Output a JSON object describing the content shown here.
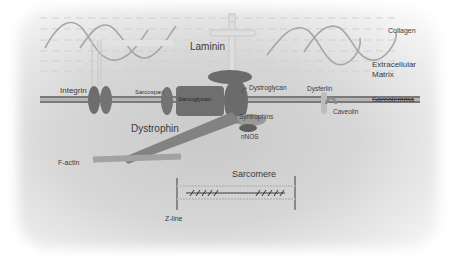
{
  "diagram": {
    "labels": {
      "laminin": "Laminin",
      "collagen": "Collagen",
      "ecm_line1": "Extracellular",
      "ecm_line2": "Matrix",
      "integrin": "Integrin",
      "sarcospan": "Sarcospan",
      "sarcoglycan": "Sarcoglycan",
      "dystroglycan": "Dystroglycan",
      "dysferlin": "Dysferlin",
      "sarcolemma": "Sarcolemma",
      "caveolin": "Caveolin",
      "dystrophin": "Dystrophin",
      "syntrophins": "Syntrophins",
      "nnos": "nNOS",
      "f_actin": "F-actin",
      "sarcomere": "Sarcomere",
      "z_line": "Z-line"
    },
    "colors": {
      "protein_dark": "#6b6b6b",
      "protein_mid": "#7d7d7d",
      "membrane": "#7a7a7a",
      "collagen_wave": "#a6a6a6",
      "dashed_line": "#cfcfcf",
      "text": "#3a3a3a"
    }
  }
}
